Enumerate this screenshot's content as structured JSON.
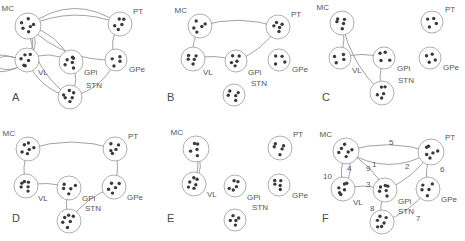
{
  "figure": {
    "width": 465,
    "height": 241,
    "panel_cols": 3,
    "panel_rows": 2,
    "edge_color": "#8a8a8a",
    "node_stroke": "#9a9a9a",
    "dot_color": "#3a3a3a",
    "label_color": "#555555"
  },
  "regions": {
    "MC": "MC",
    "PT": "PT",
    "VL": "VL",
    "GPi": "GPi",
    "GPe": "GPe",
    "STN": "STN"
  },
  "panels": [
    {
      "id": "A",
      "letter": "A",
      "origin": [
        0,
        0
      ],
      "nodes": [
        {
          "key": "MC",
          "label": "MC",
          "cx": 28,
          "cy": 26,
          "r": 13,
          "dots": 6,
          "label_dx": -14,
          "label_dy": -15
        },
        {
          "key": "PT",
          "label": "PT",
          "cx": 120,
          "cy": 24,
          "r": 12,
          "dots": 5,
          "label_dx": 13,
          "label_dy": -10
        },
        {
          "key": "VL",
          "label": "VL",
          "cx": 27,
          "cy": 60,
          "r": 12,
          "dots": 6,
          "label_dx": 11,
          "label_dy": 15
        },
        {
          "key": "GPi",
          "label": "GPi",
          "cx": 71,
          "cy": 62,
          "r": 12,
          "dots": 6,
          "label_dx": 13,
          "label_dy": 13
        },
        {
          "key": "GPe",
          "label": "GPe",
          "cx": 116,
          "cy": 60,
          "r": 11,
          "dots": 4,
          "label_dx": 13,
          "label_dy": 12
        },
        {
          "key": "STN",
          "label": "STN",
          "cx": 70,
          "cy": 97,
          "r": 12,
          "dots": 6,
          "label_dx": 16,
          "label_dy": -9
        }
      ],
      "edges": [
        [
          "MC",
          "PT"
        ],
        [
          "MC",
          "PT"
        ],
        [
          "MC",
          "VL"
        ],
        [
          "MC",
          "VL"
        ],
        [
          "MC",
          "GPi"
        ],
        [
          "MC",
          "STN"
        ],
        [
          "VL",
          "GPi"
        ],
        [
          "VL",
          "STN"
        ],
        [
          "GPi",
          "STN"
        ],
        [
          "PT",
          "GPe"
        ],
        [
          "GPe",
          "STN"
        ],
        [
          "VL",
          "VL"
        ],
        [
          "VL",
          "VL"
        ],
        [
          "MC",
          "GPe"
        ]
      ],
      "description": "Densely connected network with multiple loops at VL"
    },
    {
      "id": "B",
      "letter": "B",
      "origin": [
        155,
        0
      ],
      "nodes": [
        {
          "key": "MC",
          "label": "MC",
          "cx": 45,
          "cy": 26,
          "r": 12,
          "dots": 5,
          "label_dx": -13,
          "label_dy": -13
        },
        {
          "key": "PT",
          "label": "PT",
          "cx": 123,
          "cy": 27,
          "r": 12,
          "dots": 5,
          "label_dx": 13,
          "label_dy": -10
        },
        {
          "key": "VL",
          "label": "VL",
          "cx": 38,
          "cy": 59,
          "r": 12,
          "dots": 5,
          "label_dx": 10,
          "label_dy": 16
        },
        {
          "key": "GPi",
          "label": "GPi",
          "cx": 81,
          "cy": 61,
          "r": 11,
          "dots": 5,
          "label_dx": 12,
          "label_dy": 14
        },
        {
          "key": "GPe",
          "label": "GPe",
          "cx": 124,
          "cy": 60,
          "r": 11,
          "dots": 4,
          "label_dx": 13,
          "label_dy": 12
        },
        {
          "key": "STN",
          "label": "STN",
          "cx": 79,
          "cy": 95,
          "r": 11,
          "dots": 5,
          "label_dx": 17,
          "label_dy": -9
        }
      ],
      "edges": [
        [
          "MC",
          "PT"
        ],
        [
          "MC",
          "VL"
        ],
        [
          "VL",
          "GPi"
        ],
        [
          "GPi",
          "PT"
        ]
      ],
      "description": "Sparse chain: MC-PT, MC-VL, VL-GPi, GPi-PT"
    },
    {
      "id": "C",
      "letter": "C",
      "origin": [
        310,
        0
      ],
      "nodes": [
        {
          "key": "MC",
          "label": "MC",
          "cx": 32,
          "cy": 23,
          "r": 12,
          "dots": 5,
          "label_dx": -13,
          "label_dy": -13
        },
        {
          "key": "PT",
          "label": "PT",
          "cx": 122,
          "cy": 22,
          "r": 11,
          "dots": 4,
          "label_dx": 13,
          "label_dy": -10
        },
        {
          "key": "VL",
          "label": "VL",
          "cx": 30,
          "cy": 58,
          "r": 11,
          "dots": 4,
          "label_dx": 12,
          "label_dy": 15
        },
        {
          "key": "GPi",
          "label": "GPi",
          "cx": 74,
          "cy": 58,
          "r": 11,
          "dots": 4,
          "label_dx": 13,
          "label_dy": 13
        },
        {
          "key": "GPe",
          "label": "GPe",
          "cx": 120,
          "cy": 58,
          "r": 11,
          "dots": 4,
          "label_dx": 13,
          "label_dy": 12
        },
        {
          "key": "STN",
          "label": "STN",
          "cx": 72,
          "cy": 93,
          "r": 12,
          "dots": 5,
          "label_dx": 16,
          "label_dy": -10
        }
      ],
      "edges": [
        [
          "MC",
          "VL"
        ],
        [
          "MC",
          "STN"
        ],
        [
          "VL",
          "GPi"
        ],
        [
          "GPi",
          "STN"
        ]
      ],
      "description": "MC projects to VL and STN; VL-GPi and GPi-STN links"
    },
    {
      "id": "D",
      "letter": "D",
      "origin": [
        0,
        121
      ],
      "nodes": [
        {
          "key": "MC",
          "label": "MC",
          "cx": 28,
          "cy": 28,
          "r": 12,
          "dots": 6,
          "label_dx": -13,
          "label_dy": -13
        },
        {
          "key": "PT",
          "label": "PT",
          "cx": 115,
          "cy": 28,
          "r": 12,
          "dots": 5,
          "label_dx": 13,
          "label_dy": -10
        },
        {
          "key": "VL",
          "label": "VL",
          "cx": 26,
          "cy": 65,
          "r": 12,
          "dots": 6,
          "label_dx": 12,
          "label_dy": 15
        },
        {
          "key": "GPi",
          "label": "GPi",
          "cx": 69,
          "cy": 67,
          "r": 12,
          "dots": 5,
          "label_dx": 13,
          "label_dy": 13
        },
        {
          "key": "GPe",
          "label": "GPe",
          "cx": 114,
          "cy": 66,
          "r": 12,
          "dots": 5,
          "label_dx": 13,
          "label_dy": 13
        },
        {
          "key": "STN",
          "label": "STN",
          "cx": 69,
          "cy": 100,
          "r": 12,
          "dots": 6,
          "label_dx": 16,
          "label_dy": -10
        }
      ],
      "edges": [
        [
          "MC",
          "PT"
        ],
        [
          "MC",
          "VL"
        ],
        [
          "VL",
          "GPi"
        ],
        [
          "GPi",
          "STN"
        ],
        [
          "STN",
          "GPe"
        ],
        [
          "GPe",
          "PT"
        ]
      ],
      "description": "Single cycle through all six regions"
    },
    {
      "id": "E",
      "letter": "E",
      "origin": [
        155,
        121
      ],
      "nodes": [
        {
          "key": "MC",
          "label": "MC",
          "cx": 41,
          "cy": 28,
          "r": 13,
          "dots": 5,
          "label_dx": -13,
          "label_dy": -14
        },
        {
          "key": "PT",
          "label": "PT",
          "cx": 125,
          "cy": 27,
          "r": 12,
          "dots": 5,
          "label_dx": 13,
          "label_dy": -11
        },
        {
          "key": "VL",
          "label": "VL",
          "cx": 39,
          "cy": 63,
          "r": 12,
          "dots": 6,
          "label_dx": 13,
          "label_dy": 13
        },
        {
          "key": "GPi",
          "label": "GPi",
          "cx": 80,
          "cy": 65,
          "r": 11,
          "dots": 5,
          "label_dx": 12,
          "label_dy": 14
        },
        {
          "key": "GPe",
          "label": "GPe",
          "cx": 124,
          "cy": 64,
          "r": 11,
          "dots": 5,
          "label_dx": 13,
          "label_dy": 13
        },
        {
          "key": "STN",
          "label": "STN",
          "cx": 80,
          "cy": 99,
          "r": 11,
          "dots": 5,
          "label_dx": 17,
          "label_dy": -10
        }
      ],
      "edges": [
        [
          "MC",
          "VL"
        ],
        [
          "MC",
          "VL"
        ]
      ],
      "description": "Only two reciprocal MC-VL connections; all other nodes isolated"
    },
    {
      "id": "F",
      "letter": "F",
      "origin": [
        310,
        121
      ],
      "nodes": [
        {
          "key": "MC",
          "label": "MC",
          "cx": 36,
          "cy": 30,
          "r": 13,
          "dots": 6,
          "label_dx": -14,
          "label_dy": -14
        },
        {
          "key": "PT",
          "label": "PT",
          "cx": 121,
          "cy": 31,
          "r": 13,
          "dots": 6,
          "label_dx": 14,
          "label_dy": -12
        },
        {
          "key": "VL",
          "label": "VL",
          "cx": 33,
          "cy": 68,
          "r": 12,
          "dots": 6,
          "label_dx": 10,
          "label_dy": 16
        },
        {
          "key": "GPi",
          "label": "GPi",
          "cx": 75,
          "cy": 69,
          "r": 12,
          "dots": 6,
          "label_dx": 13,
          "label_dy": 14
        },
        {
          "key": "GPe",
          "label": "GPe",
          "cx": 118,
          "cy": 68,
          "r": 12,
          "dots": 5,
          "label_dx": 13,
          "label_dy": 13
        },
        {
          "key": "STN",
          "label": "STN",
          "cx": 72,
          "cy": 101,
          "r": 12,
          "dots": 6,
          "label_dx": 16,
          "label_dy": -8
        }
      ],
      "edges": [
        [
          "MC",
          "PT"
        ],
        [
          "GPi",
          "PT"
        ],
        [
          "VL",
          "GPi"
        ],
        [
          "MC",
          "VL"
        ],
        [
          "MC",
          "PT"
        ],
        [
          "PT",
          "GPe"
        ],
        [
          "GPe",
          "STN"
        ],
        [
          "GPi",
          "STN"
        ],
        [
          "MC",
          "GPi"
        ],
        [
          "MC",
          "VL"
        ]
      ],
      "numbered": true,
      "edge_numbers": [
        {
          "n": "1",
          "x": 62,
          "y": 46
        },
        {
          "n": "2",
          "x": 95,
          "y": 48
        },
        {
          "n": "3",
          "x": 56,
          "y": 66
        },
        {
          "n": "4",
          "x": 37,
          "y": 50
        },
        {
          "n": "5",
          "x": 79,
          "y": 24
        },
        {
          "n": "6",
          "x": 130,
          "y": 51
        },
        {
          "n": "7",
          "x": 106,
          "y": 100
        },
        {
          "n": "8",
          "x": 60,
          "y": 90
        },
        {
          "n": "9",
          "x": 56,
          "y": 50
        },
        {
          "n": "10",
          "x": 13,
          "y": 58
        }
      ],
      "description": "Same topology as panel A core with edges numbered 1 through 10"
    }
  ]
}
